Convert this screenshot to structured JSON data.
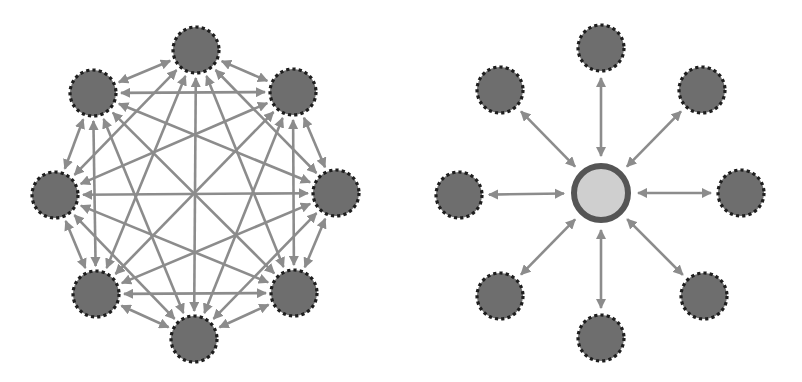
{
  "colors": {
    "background": "#ffffff",
    "arrow": "#8c8c8c",
    "node_fill": "#6e6e6e",
    "node_border": "#1e1e1e",
    "hub_fill": "#cfcfcf",
    "hub_ring": "#555555"
  },
  "diagrams": [
    {
      "id": "mesh",
      "title": "Fully connected mesh (peer-to-peer)",
      "node_radius": 23,
      "nodes": [
        {
          "id": "n-top",
          "x": 196,
          "y": 50
        },
        {
          "id": "n-top-right",
          "x": 293,
          "y": 92
        },
        {
          "id": "n-right",
          "x": 336,
          "y": 193
        },
        {
          "id": "n-bottom-right",
          "x": 294,
          "y": 293
        },
        {
          "id": "n-bottom",
          "x": 194,
          "y": 339
        },
        {
          "id": "n-bottom-left",
          "x": 96,
          "y": 294
        },
        {
          "id": "n-left",
          "x": 55,
          "y": 195
        },
        {
          "id": "n-top-left",
          "x": 93,
          "y": 93
        }
      ],
      "connections": "all-pairs, bidirectional"
    },
    {
      "id": "star",
      "title": "Hub-and-spoke (star)",
      "node_radius": 23,
      "hub": {
        "id": "hub",
        "x": 601,
        "y": 193,
        "r": 30
      },
      "nodes": [
        {
          "id": "s-top",
          "x": 601,
          "y": 48
        },
        {
          "id": "s-top-right",
          "x": 702,
          "y": 90
        },
        {
          "id": "s-right",
          "x": 741,
          "y": 193
        },
        {
          "id": "s-bottom-right",
          "x": 704,
          "y": 296
        },
        {
          "id": "s-bottom",
          "x": 601,
          "y": 338
        },
        {
          "id": "s-bottom-left",
          "x": 500,
          "y": 296
        },
        {
          "id": "s-left",
          "x": 459,
          "y": 195
        },
        {
          "id": "s-top-left",
          "x": 500,
          "y": 90
        }
      ],
      "connections": "each node to hub, bidirectional"
    }
  ]
}
